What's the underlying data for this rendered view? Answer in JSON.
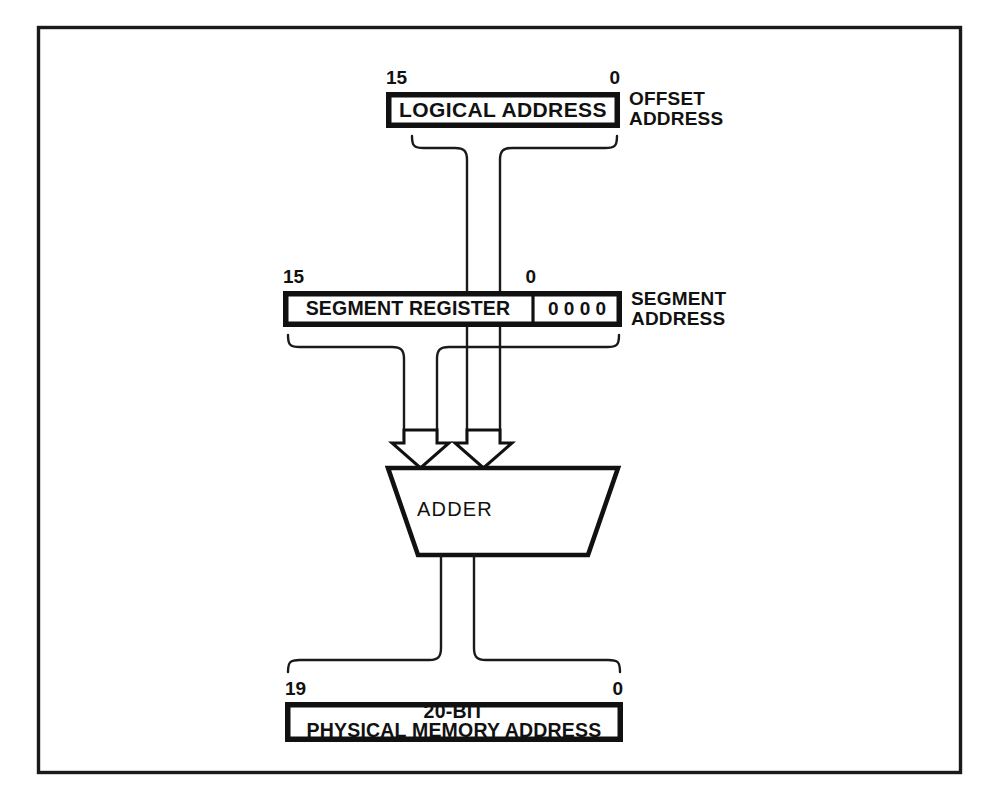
{
  "diagram": {
    "background_color": "#ffffff",
    "line_color": "#111111",
    "frame": {
      "name": "outer-border"
    },
    "logical_address": {
      "box_label": "LOGICAL ADDRESS",
      "side_label_line1": "OFFSET",
      "side_label_line2": "ADDRESS",
      "tick_high": "15",
      "tick_low": "0",
      "bit_width": 16
    },
    "segment_register": {
      "box_label": "SEGMENT REGISTER",
      "appended_zeros": "0 0 0 0",
      "side_label_line1": "SEGMENT",
      "side_label_line2": "ADDRESS",
      "tick_high": "15",
      "tick_low": "0",
      "bit_width": 16,
      "shift_digits": 4
    },
    "adder": {
      "label": "ADDER",
      "input_count": 2
    },
    "physical_address": {
      "box_label_line1": "20-BIT",
      "box_label_line2": "PHYSICAL MEMORY ADDRESS",
      "tick_high": "19",
      "tick_low": "0",
      "bit_width": 20
    }
  }
}
